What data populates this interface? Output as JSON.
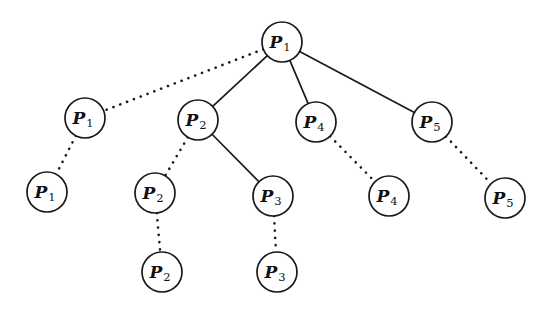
{
  "figure": {
    "background_color": "#ffffff",
    "stroke_color": "#1a1a1a",
    "width": 554,
    "height": 311
  },
  "nodes": [
    {
      "id": "root-p1",
      "label": "P",
      "subscript": "1",
      "full": "P1",
      "cx": 282,
      "cy": 42,
      "r": 20,
      "level": 0
    },
    {
      "id": "l1-p1",
      "label": "P",
      "subscript": "1",
      "full": "P1",
      "cx": 85,
      "cy": 118,
      "r": 20,
      "level": 1
    },
    {
      "id": "l1-p2",
      "label": "P",
      "subscript": "2",
      "full": "P2",
      "cx": 198,
      "cy": 120,
      "r": 20,
      "level": 1
    },
    {
      "id": "l1-p4",
      "label": "P",
      "subscript": "4",
      "full": "P4",
      "cx": 316,
      "cy": 122,
      "r": 20,
      "level": 1
    },
    {
      "id": "l1-p5",
      "label": "P",
      "subscript": "5",
      "full": "P5",
      "cx": 432,
      "cy": 122,
      "r": 20,
      "level": 1
    },
    {
      "id": "l2-p1",
      "label": "P",
      "subscript": "1",
      "full": "P1",
      "cx": 47,
      "cy": 192,
      "r": 20,
      "level": 2
    },
    {
      "id": "l2-p2",
      "label": "P",
      "subscript": "2",
      "full": "P2",
      "cx": 155,
      "cy": 193,
      "r": 20,
      "level": 2
    },
    {
      "id": "l2-p3",
      "label": "P",
      "subscript": "3",
      "full": "P3",
      "cx": 273,
      "cy": 196,
      "r": 20,
      "level": 2
    },
    {
      "id": "l2-p4",
      "label": "P",
      "subscript": "4",
      "full": "P4",
      "cx": 389,
      "cy": 196,
      "r": 20,
      "level": 2
    },
    {
      "id": "l2-p5",
      "label": "P",
      "subscript": "5",
      "full": "P5",
      "cx": 505,
      "cy": 198,
      "r": 20,
      "level": 2
    },
    {
      "id": "l3-p2",
      "label": "P",
      "subscript": "2",
      "full": "P2",
      "cx": 162,
      "cy": 272,
      "r": 20,
      "level": 3
    },
    {
      "id": "l3-p3",
      "label": "P",
      "subscript": "3",
      "full": "P3",
      "cx": 277,
      "cy": 272,
      "r": 20,
      "level": 3
    }
  ],
  "edges": [
    {
      "id": "e-root-l1p1",
      "from": "root-p1",
      "to": "l1-p1",
      "style": "dotted"
    },
    {
      "id": "e-root-l1p2",
      "from": "root-p1",
      "to": "l1-p2",
      "style": "solid"
    },
    {
      "id": "e-root-l1p4",
      "from": "root-p1",
      "to": "l1-p4",
      "style": "solid"
    },
    {
      "id": "e-root-l1p5",
      "from": "root-p1",
      "to": "l1-p5",
      "style": "solid"
    },
    {
      "id": "e-l1p1-l2p1",
      "from": "l1-p1",
      "to": "l2-p1",
      "style": "dotted"
    },
    {
      "id": "e-l1p2-l2p2",
      "from": "l1-p2",
      "to": "l2-p2",
      "style": "dotted"
    },
    {
      "id": "e-l1p2-l2p3",
      "from": "l1-p2",
      "to": "l2-p3",
      "style": "solid"
    },
    {
      "id": "e-l1p4-l2p4",
      "from": "l1-p4",
      "to": "l2-p4",
      "style": "dotted"
    },
    {
      "id": "e-l1p5-l2p5",
      "from": "l1-p5",
      "to": "l2-p5",
      "style": "dotted"
    },
    {
      "id": "e-l2p2-l3p2",
      "from": "l2-p2",
      "to": "l3-p2",
      "style": "dotted"
    },
    {
      "id": "e-l2p3-l3p3",
      "from": "l2-p3",
      "to": "l3-p3",
      "style": "dotted"
    }
  ]
}
